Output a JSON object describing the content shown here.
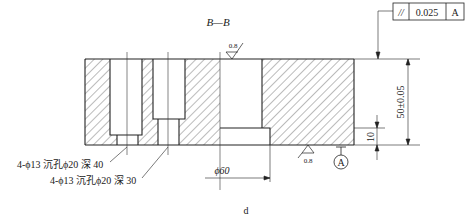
{
  "drawing": {
    "section_label": "B—B",
    "figure_label": "d",
    "tolerance_frame": {
      "symbol": "//",
      "value": "0.025",
      "datum": "A",
      "type": "parallelism"
    },
    "roughness_top": "0.8",
    "roughness_bottom": "0.8",
    "datum_marker": "A",
    "dimensions": {
      "height": "50±0.05",
      "step_height": "10",
      "diameter": "ϕ60"
    },
    "callouts": [
      "4-ϕ13 沉孔ϕ20 深 40",
      "4-ϕ13 沉孔ϕ20 深 30"
    ]
  }
}
